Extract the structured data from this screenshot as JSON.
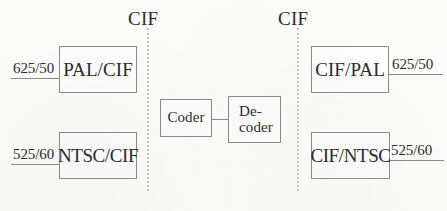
{
  "diagram": {
    "boundaries": [
      {
        "name": "left",
        "label": "CIF"
      },
      {
        "name": "right",
        "label": "CIF"
      }
    ],
    "blocks": {
      "pal_cif": "PAL/CIF",
      "ntsc_cif": "NTSC/CIF",
      "coder": "Coder",
      "decoder": "De-\ncoder",
      "cif_pal": "CIF/PAL",
      "cif_ntsc": "CIF/NTSC"
    },
    "rates": {
      "pal_in": "625/50",
      "ntsc_in": "525/60",
      "pal_out": "625/50",
      "ntsc_out": "525/60"
    },
    "colors": {
      "background": "#fdfdfc",
      "stroke": "#8e8e8e",
      "text": "#2d2d2d",
      "boundary_dotted": "#c2c2c2"
    }
  }
}
